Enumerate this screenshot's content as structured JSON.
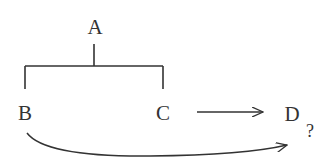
{
  "diagram": {
    "nodes": [
      {
        "id": "A",
        "label": "A"
      },
      {
        "id": "B",
        "label": "B"
      },
      {
        "id": "C",
        "label": "C"
      },
      {
        "id": "D",
        "label": "D"
      }
    ],
    "annotation": "?",
    "edges": [
      {
        "from": "A",
        "to": [
          "B",
          "C"
        ],
        "type": "bracket"
      },
      {
        "from": "C",
        "to": "D",
        "type": "straight-arrow"
      },
      {
        "from": "B",
        "to": "D",
        "type": "curved-arrow",
        "label": "?"
      }
    ],
    "colors": {
      "stroke": "#333333",
      "background": "#ffffff"
    }
  }
}
